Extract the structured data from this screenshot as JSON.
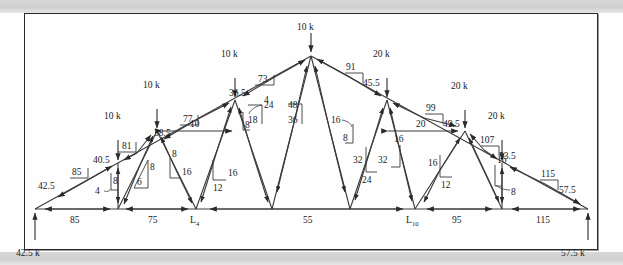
{
  "figure": {
    "type": "truss-force-diagram",
    "title": "",
    "units": "k",
    "supports": {
      "left_reaction": "42.5 k",
      "right_reaction": "57.5 k"
    },
    "node_labels": [
      {
        "id": "L4",
        "base": "L",
        "sub": "4"
      },
      {
        "id": "L10",
        "base": "L",
        "sub": "10"
      }
    ],
    "loads": [
      {
        "id": "load-1",
        "label": "10 k"
      },
      {
        "id": "load-2",
        "label": "10 k"
      },
      {
        "id": "load-3",
        "label": "10 k"
      },
      {
        "id": "load-4",
        "label": "10 k"
      },
      {
        "id": "load-5",
        "label": "20 k"
      },
      {
        "id": "load-6",
        "label": "20 k"
      },
      {
        "id": "load-7",
        "label": "20 k"
      }
    ],
    "bottom_chord_forces": [
      "85",
      "75",
      "55",
      "95",
      "115"
    ],
    "top_chord_left_forces": [
      "85",
      "81",
      "77",
      "73"
    ],
    "top_chord_right_forces": [
      "91",
      "99",
      "107",
      "115"
    ],
    "horizontal_web_forces": [
      "10",
      "20"
    ],
    "slope_triangles": [
      {
        "id": "st-1",
        "run": "42.5",
        "rise": "85"
      },
      {
        "id": "st-2",
        "run": "40.5",
        "rise": "81"
      },
      {
        "id": "st-3",
        "run": "38.5",
        "rise": "77"
      },
      {
        "id": "st-4",
        "run": "36.5",
        "rise": "73"
      },
      {
        "id": "st-5",
        "run": "45.5",
        "rise": "91"
      },
      {
        "id": "st-6",
        "run": "49.5",
        "rise": "99"
      },
      {
        "id": "st-7",
        "run": "53.5",
        "rise": "107"
      },
      {
        "id": "st-8",
        "run": "57.5",
        "rise": "115"
      },
      {
        "id": "st-9",
        "a": "4",
        "b": "8"
      },
      {
        "id": "st-10",
        "a": "6",
        "b": "8"
      },
      {
        "id": "st-11",
        "a": "16",
        "b": "8"
      },
      {
        "id": "st-12",
        "a": "12",
        "b": "16"
      },
      {
        "id": "st-13",
        "a": "4",
        "b": "8"
      },
      {
        "id": "st-14",
        "a": "18",
        "b": "24"
      },
      {
        "id": "st-15",
        "a": "36",
        "b": "48"
      },
      {
        "id": "st-16",
        "a": "8",
        "b": "16"
      },
      {
        "id": "st-17",
        "a": "24",
        "b": "32"
      },
      {
        "id": "st-18",
        "a": "16",
        "b": "32"
      },
      {
        "id": "st-19",
        "a": "12",
        "b": "16"
      },
      {
        "id": "st-20",
        "a": "8",
        "b": "16"
      }
    ],
    "texts": {
      "t_10k_a": "10 k",
      "t_10k_b": "10 k",
      "t_10k_c": "10 k",
      "t_10k_d": "10 k",
      "t_20k_a": "20 k",
      "t_20k_b": "20 k",
      "t_20k_c": "20 k",
      "r_left": "42.5 k",
      "r_right": "57.5 k",
      "b85": "85",
      "b75": "75",
      "b55": "55",
      "b95": "95",
      "b115": "115",
      "c85": "85",
      "c81": "81",
      "c77": "77",
      "c73": "73",
      "c91": "91",
      "c99": "99",
      "c107": "107",
      "c115": "115",
      "s42_5": "42.5",
      "s40_5": "40.5",
      "s38_5": "38.5",
      "s36_5": "36.5",
      "s45_5": "45.5",
      "s49_5": "49.5",
      "s53_5": "53.5",
      "s57_5": "57.5",
      "h10": "10",
      "h20": "20",
      "w4a": "4",
      "w8a": "8",
      "w6": "6",
      "w8b": "8",
      "w8c": "8",
      "w16a": "16",
      "w12a": "12",
      "w16b": "16",
      "w4b": "4",
      "w8d": "8",
      "w18": "18",
      "w24a": "24",
      "w36": "36",
      "w48": "48",
      "w16c": "16",
      "w8e": "8",
      "w24b": "24",
      "w32a": "32",
      "w16d": "16",
      "w32b": "32",
      "w12b": "12",
      "w16e": "16",
      "w16f": "16",
      "w8f": "8",
      "nL": "L",
      "n4": "4",
      "nL2": "L",
      "n10": "10"
    }
  }
}
